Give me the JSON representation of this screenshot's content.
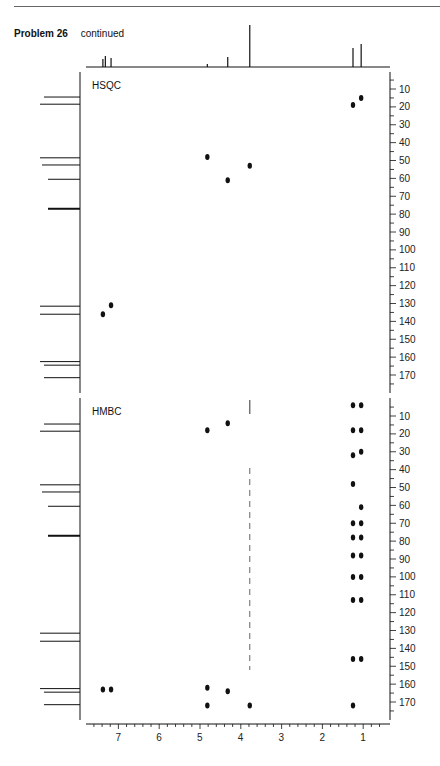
{
  "header": {
    "problem": "Problem 26",
    "status": "continued"
  },
  "chart_data": [
    {
      "type": "scatter",
      "title": "HSQC",
      "xlabel": "1H (ppm)",
      "ylabel": "13C (ppm)",
      "xlim": [
        7.8,
        0.4
      ],
      "ylim": [
        0,
        180
      ],
      "x_ticks": [
        7,
        6,
        5,
        4,
        3,
        2,
        1
      ],
      "y_ticks": [
        10,
        20,
        30,
        40,
        50,
        60,
        70,
        80,
        90,
        100,
        110,
        120,
        130,
        140,
        150,
        160,
        170
      ],
      "points": [
        {
          "h": 1.05,
          "c": 15
        },
        {
          "h": 1.25,
          "c": 19
        },
        {
          "h": 4.82,
          "c": 48
        },
        {
          "h": 3.78,
          "c": 53
        },
        {
          "h": 4.32,
          "c": 61
        },
        {
          "h": 7.18,
          "c": 131
        },
        {
          "h": 7.38,
          "c": 136
        }
      ]
    },
    {
      "type": "scatter",
      "title": "HMBC",
      "xlabel": "1H (ppm)",
      "ylabel": "13C (ppm)",
      "xlim": [
        7.8,
        0.4
      ],
      "ylim": [
        0,
        180
      ],
      "x_ticks": [
        7,
        6,
        5,
        4,
        3,
        2,
        1
      ],
      "y_ticks": [
        10,
        20,
        30,
        40,
        50,
        60,
        70,
        80,
        90,
        100,
        110,
        120,
        130,
        140,
        150,
        160,
        170
      ],
      "points": [
        {
          "h": 4.32,
          "c": 14
        },
        {
          "h": 4.82,
          "c": 18
        },
        {
          "h": 1.25,
          "c": 4
        },
        {
          "h": 1.05,
          "c": 4
        },
        {
          "h": 1.25,
          "c": 18
        },
        {
          "h": 1.05,
          "c": 18
        },
        {
          "h": 1.25,
          "c": 32
        },
        {
          "h": 1.05,
          "c": 30
        },
        {
          "h": 1.25,
          "c": 48
        },
        {
          "h": 1.05,
          "c": 61
        },
        {
          "h": 1.25,
          "c": 70
        },
        {
          "h": 1.05,
          "c": 70
        },
        {
          "h": 1.25,
          "c": 78
        },
        {
          "h": 1.05,
          "c": 78
        },
        {
          "h": 1.25,
          "c": 88
        },
        {
          "h": 1.05,
          "c": 88
        },
        {
          "h": 1.25,
          "c": 100
        },
        {
          "h": 1.05,
          "c": 100
        },
        {
          "h": 1.25,
          "c": 113
        },
        {
          "h": 1.05,
          "c": 113
        },
        {
          "h": 1.25,
          "c": 146
        },
        {
          "h": 1.05,
          "c": 146
        },
        {
          "h": 1.25,
          "c": 172
        },
        {
          "h": 7.38,
          "c": 163
        },
        {
          "h": 7.18,
          "c": 163
        },
        {
          "h": 4.82,
          "c": 162
        },
        {
          "h": 4.32,
          "c": 164
        },
        {
          "h": 4.82,
          "c": 172
        },
        {
          "h": 3.78,
          "c": 172
        }
      ],
      "streak_h": 3.78
    }
  ],
  "proton_1d": {
    "peaks": [
      {
        "ppm": 7.38,
        "height": 8
      },
      {
        "ppm": 7.32,
        "height": 11
      },
      {
        "ppm": 7.18,
        "height": 9
      },
      {
        "ppm": 4.82,
        "height": 3
      },
      {
        "ppm": 4.32,
        "height": 10
      },
      {
        "ppm": 3.78,
        "height": 42
      },
      {
        "ppm": 1.25,
        "height": 19
      },
      {
        "ppm": 1.05,
        "height": 23
      }
    ]
  },
  "carbon_1d": {
    "peaks": [
      {
        "ppm": 14.5,
        "len": 36
      },
      {
        "ppm": 18.5,
        "len": 40
      },
      {
        "ppm": 48.5,
        "len": 40
      },
      {
        "ppm": 52.5,
        "len": 38
      },
      {
        "ppm": 60.5,
        "len": 32
      },
      {
        "ppm": 77.0,
        "len": 32,
        "thick": true
      },
      {
        "ppm": 131.5,
        "len": 40
      },
      {
        "ppm": 136.0,
        "len": 40
      },
      {
        "ppm": 162.5,
        "len": 40
      },
      {
        "ppm": 164.5,
        "len": 36
      },
      {
        "ppm": 171.5,
        "len": 36
      }
    ]
  },
  "colors": {
    "ink": "#111111",
    "axis": "#222222"
  }
}
